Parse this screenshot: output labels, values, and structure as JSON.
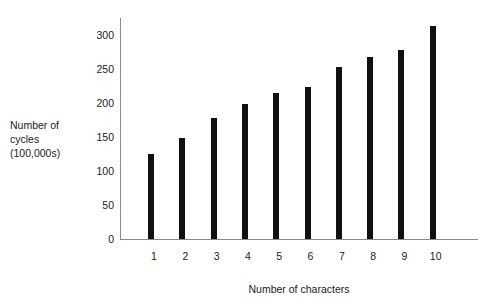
{
  "chart_data": {
    "type": "bar",
    "title": "",
    "xlabel": "Number of characters",
    "ylabel": "Number of cycles (100,000s)",
    "ylabel_lines": [
      "Number of",
      "cycles",
      "(100,000s)"
    ],
    "categories": [
      "1",
      "2",
      "3",
      "4",
      "5",
      "6",
      "7",
      "8",
      "9",
      "10"
    ],
    "values": [
      125,
      149,
      178,
      199,
      214,
      224,
      253,
      268,
      278,
      313
    ],
    "ylim": [
      0,
      325
    ],
    "yticks": [
      0,
      50,
      100,
      150,
      200,
      250,
      300
    ],
    "ytick_labels": [
      "0",
      "50",
      "100",
      "150",
      "200",
      "250",
      "300"
    ],
    "grid": false,
    "legend": null,
    "bar_color": "#111111",
    "axis_color": "#8a8a8a",
    "background_color": "#ffffff"
  }
}
